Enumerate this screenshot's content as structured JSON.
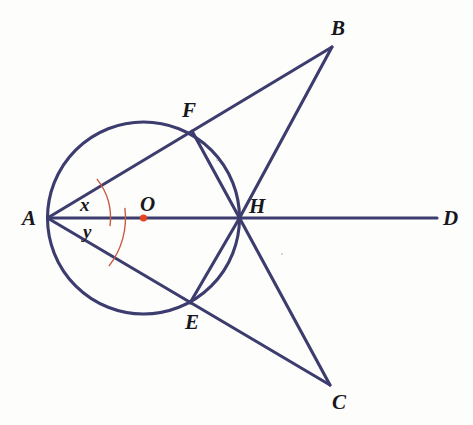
{
  "figure": {
    "width": 473,
    "height": 425,
    "background_color": "#fdfdfb"
  },
  "style": {
    "stroke_color": "#3c3c6e",
    "stroke_width": 3.1,
    "arc_color": "#cc5a43",
    "arc_width": 1.4,
    "center_dot_color": "#e8431f",
    "label_color": "#17171c"
  },
  "chart_data": {
    "type": "diagram",
    "subtype": "euclidean-geometry",
    "circle": {
      "label": "circle-O",
      "center_label": "O",
      "center": {
        "x": 143.5,
        "y": 218.0
      },
      "radius": 96.0
    },
    "points": [
      {
        "name": "A",
        "x": 47.5,
        "y": 218.0,
        "label_x": 22,
        "label_y": 208,
        "on_circle": true,
        "note": "left end of diameter, apex of angles x and y"
      },
      {
        "name": "B",
        "x": 332.0,
        "y": 47.0,
        "label_x": 331,
        "label_y": 18,
        "on_circle": false,
        "note": "upper external vertex"
      },
      {
        "name": "C",
        "x": 330.0,
        "y": 385.0,
        "label_x": 332,
        "label_y": 392,
        "on_circle": false,
        "note": "lower external vertex"
      },
      {
        "name": "D",
        "x": 437.0,
        "y": 218.0,
        "label_x": 443,
        "label_y": 208,
        "on_circle": false,
        "note": "right end of extended diameter ray"
      },
      {
        "name": "E",
        "x": 190.0,
        "y": 303.0,
        "label_x": 185,
        "label_y": 312,
        "on_circle": true,
        "note": "lower intersection of secant AC with circle"
      },
      {
        "name": "F",
        "x": 192.0,
        "y": 131.0,
        "label_x": 182,
        "label_y": 100,
        "on_circle": true,
        "note": "upper intersection of secant AB with circle"
      },
      {
        "name": "H",
        "x": 239.5,
        "y": 218.0,
        "label_x": 249,
        "label_y": 196,
        "on_circle": true,
        "note": "right end of diameter, concurrency point of FH, EH, HB, HC and AD"
      }
    ],
    "segments": [
      {
        "name": "A-D",
        "from": "A",
        "to": "D",
        "description": "horizontal ray through diameter AH extended to D"
      },
      {
        "name": "A-B",
        "from": "A",
        "to": "B",
        "description": "upper secant from A through F to B"
      },
      {
        "name": "A-C",
        "from": "A",
        "to": "C",
        "description": "lower secant from A through E to C"
      },
      {
        "name": "F-H",
        "from": "F",
        "to": "H",
        "description": "chord from F to H"
      },
      {
        "name": "E-H",
        "from": "E",
        "to": "H",
        "description": "chord from E to H"
      },
      {
        "name": "H-B",
        "from": "H",
        "to": "B",
        "description": "side of triangle FHB"
      },
      {
        "name": "H-C",
        "from": "H",
        "to": "C",
        "description": "side of triangle EHC"
      }
    ],
    "angles": [
      {
        "label": "x",
        "vertex": "A",
        "between": [
          "A-D",
          "A-B"
        ],
        "label_x": 80,
        "label_y": 195,
        "arc_radius": 63,
        "color": "#cc5a43"
      },
      {
        "label": "y",
        "vertex": "A",
        "between": [
          "A-D",
          "A-C"
        ],
        "label_x": 83,
        "label_y": 222,
        "arc_radius": 78,
        "color": "#cc5a43"
      }
    ],
    "markers": [
      {
        "name": "center-dot",
        "point": "O",
        "x": 143.5,
        "y": 218.0,
        "color": "#e8431f",
        "radius": 3.6
      }
    ],
    "labels": [
      "A",
      "B",
      "C",
      "D",
      "E",
      "F",
      "H",
      "O",
      "x",
      "y"
    ]
  }
}
